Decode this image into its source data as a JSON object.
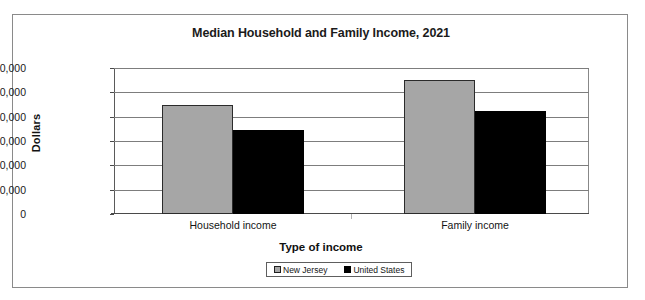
{
  "chart_data": {
    "type": "bar",
    "title": "Median Household and Family Income, 2021",
    "xlabel": "Type of income",
    "ylabel": "Dollars",
    "categories": [
      "Household income",
      "Family income"
    ],
    "series": [
      {
        "name": "New Jersey",
        "color": "#a6a6a6",
        "values": [
          90000,
          110000
        ]
      },
      {
        "name": "United States",
        "color": "#000000",
        "values": [
          69000,
          84500
        ]
      }
    ],
    "ylim": [
      0,
      120000
    ],
    "ytick_values": [
      0,
      20000,
      40000,
      60000,
      80000,
      100000,
      120000
    ],
    "ytick_labels": [
      "0",
      "20,000",
      "40,000",
      "60,000",
      "80,000",
      "100,000",
      "120,000"
    ],
    "grid": true,
    "legend_position": "bottom-center"
  },
  "legend": {
    "entries": [
      {
        "label": "New Jersey",
        "swatch": "gray-square-swatch"
      },
      {
        "label": "United States",
        "swatch": "black-square-swatch"
      }
    ]
  }
}
